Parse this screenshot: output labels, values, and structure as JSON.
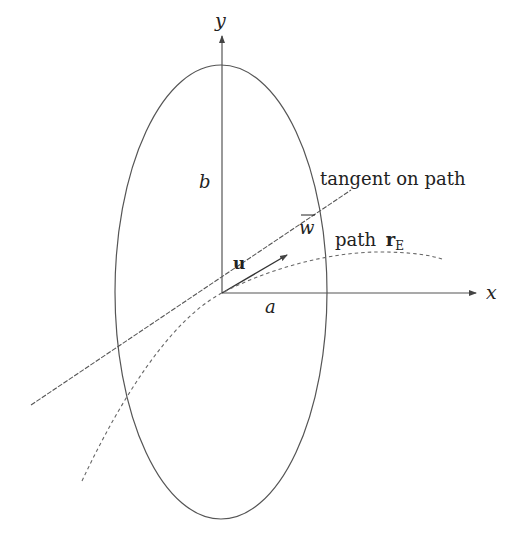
{
  "diagram": {
    "type": "geometry",
    "colors": {
      "stroke": "#555555",
      "text": "#222222",
      "background": "#ffffff"
    },
    "axes": {
      "x_label": "x",
      "y_label": "y"
    },
    "ellipse": {
      "semi_axis_x_label": "a",
      "semi_axis_y_label": "b"
    },
    "labels": {
      "tangent": "tangent on path",
      "path": "path ",
      "path_symbol": "r",
      "path_subscript": "E",
      "vector_u": "u",
      "w_bar": "w"
    }
  }
}
